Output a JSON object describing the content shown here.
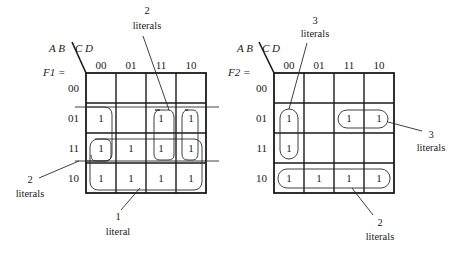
{
  "maps": [
    {
      "id": "F1",
      "function_label": "F1 =",
      "row_var": "A B",
      "col_var": "C D",
      "col_headers": [
        "00",
        "01",
        "11",
        "10"
      ],
      "row_headers": [
        "00",
        "01",
        "11",
        "10"
      ],
      "cells": [
        [
          "",
          "",
          "",
          ""
        ],
        [
          "1",
          "",
          "1",
          "1"
        ],
        [
          "1",
          "1",
          "1",
          "1"
        ],
        [
          "1",
          "1",
          "1",
          "1"
        ]
      ],
      "groups": [
        {
          "name": "wrap-col-00-rows-01-11",
          "rows": [
            1,
            2
          ],
          "cols": [
            0,
            0
          ],
          "wrap": "vertical-open"
        },
        {
          "name": "cols-11-10-rows-01-11",
          "rows": [
            1,
            2
          ],
          "cols": [
            2,
            3
          ]
        },
        {
          "name": "col-10-rows-01-11",
          "rows": [
            1,
            2
          ],
          "cols": [
            3,
            3
          ]
        },
        {
          "name": "rows-11-10-all",
          "rows": [
            2,
            3
          ],
          "cols": [
            0,
            3
          ]
        },
        {
          "name": "row-11-wrap",
          "rows": [
            2,
            2
          ],
          "cols": [
            0,
            0
          ],
          "wrap": "horizontal-open"
        }
      ],
      "annotations": [
        {
          "number": "2",
          "text": "literals",
          "target": "top-group"
        },
        {
          "number": "2",
          "text": "literals",
          "target": "left-group"
        },
        {
          "number": "1",
          "text": "literal",
          "target": "bottom-group"
        }
      ]
    },
    {
      "id": "F2",
      "function_label": "F2 =",
      "row_var": "A B",
      "col_var": "C D",
      "col_headers": [
        "00",
        "01",
        "11",
        "10"
      ],
      "row_headers": [
        "00",
        "01",
        "11",
        "10"
      ],
      "cells": [
        [
          "",
          "",
          "",
          ""
        ],
        [
          "1",
          "",
          "1",
          "1"
        ],
        [
          "1",
          "",
          "",
          ""
        ],
        [
          "1",
          "1",
          "1",
          "1"
        ]
      ],
      "groups": [
        {
          "name": "col-00-rows-01-11",
          "rows": [
            1,
            2
          ],
          "cols": [
            0,
            0
          ]
        },
        {
          "name": "row-01-cols-11-10",
          "rows": [
            1,
            1
          ],
          "cols": [
            2,
            3
          ]
        },
        {
          "name": "row-10-all",
          "rows": [
            3,
            3
          ],
          "cols": [
            0,
            3
          ]
        }
      ],
      "annotations": [
        {
          "number": "3",
          "text": "literals",
          "target": "col-group"
        },
        {
          "number": "3",
          "text": "literals",
          "target": "row01-group"
        },
        {
          "number": "2",
          "text": "literals",
          "target": "row10-group"
        }
      ]
    }
  ]
}
